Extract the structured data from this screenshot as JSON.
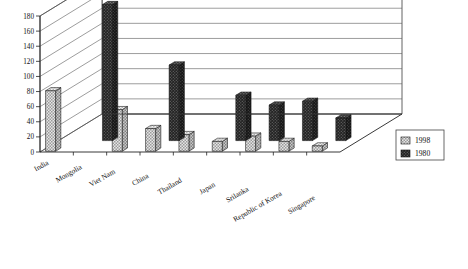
{
  "chart_data": {
    "type": "bar",
    "title": "",
    "subtitle": "",
    "xlabel": "",
    "ylabel": "",
    "ylim": [
      0,
      180
    ],
    "ytick_step": 20,
    "yticks": [
      "0",
      "20",
      "40",
      "60",
      "80",
      "100",
      "120",
      "140",
      "160",
      "180"
    ],
    "grid": true,
    "three_d": true,
    "legend_position": "right",
    "categories": [
      "India",
      "Mongolia",
      "Viet Nam",
      "China",
      "Thailand",
      "Japan",
      "Srilanka",
      "Republic of Korea",
      "Singapore"
    ],
    "series": [
      {
        "name": "1998",
        "color": "#d8d8d8",
        "pattern": "checkered-light",
        "values": [
          80,
          0,
          55,
          30,
          22,
          13,
          20,
          13,
          7
        ]
      },
      {
        "name": "1980",
        "color": "#2e2e2e",
        "pattern": "dark-dotted",
        "values": [
          0,
          180,
          0,
          100,
          0,
          60,
          47,
          52,
          30
        ]
      }
    ]
  },
  "legend": {
    "entries": [
      {
        "label": "1998",
        "swatch": "light-checkered-swatch"
      },
      {
        "label": "1980",
        "swatch": "dark-solid-swatch"
      }
    ]
  },
  "axes": {
    "y_axis_name": "value-axis",
    "x_axis_name": "category-axis"
  },
  "colors": {
    "series_1998": "#d8d8d8",
    "series_1980": "#2e2e2e",
    "grid": "#5a5a5a",
    "axis": "#222222",
    "background": "#ffffff"
  }
}
